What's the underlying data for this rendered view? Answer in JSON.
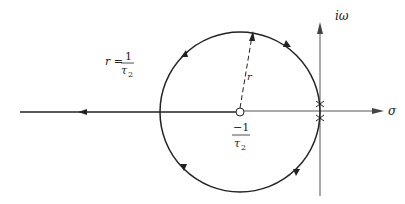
{
  "diagram": {
    "type": "root-locus",
    "axes": {
      "imag_label": "iω",
      "real_label": "σ"
    },
    "pole_label": {
      "numerator": "−1",
      "denominator_symbol": "τ",
      "denominator_subscript": "2"
    },
    "radius_label": "r",
    "radius_equation": {
      "lhs": "r =",
      "numerator": "1",
      "denominator_symbol": "τ",
      "denominator_subscript": "2"
    },
    "colors": {
      "stroke": "#222222",
      "axis": "#555555",
      "background": "#ffffff"
    }
  }
}
